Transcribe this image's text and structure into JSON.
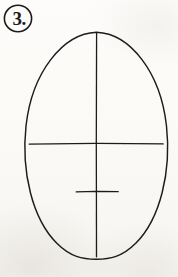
{
  "page": {
    "width": 178,
    "height": 277,
    "background_color": "#fbfaf7",
    "ink_color": "#1b1b1b",
    "medium": "pen-on-paper-scan"
  },
  "step_label": {
    "text": "3.",
    "number": "3",
    "shape": "circled",
    "icon": "circled-step-number",
    "center": {
      "x": 18,
      "y": 18
    },
    "radius": 14.5
  },
  "diagram": {
    "type": "line-drawing",
    "strokes": [
      {
        "name": "head-oval",
        "kind": "ellipse",
        "label": "Head outline (egg shape)",
        "cx": 96,
        "cy": 145,
        "rx": 72,
        "ry": 113.5,
        "stroke_width": 1.4
      },
      {
        "name": "vertical-center-line",
        "kind": "line",
        "label": "Vertical center line",
        "x1": 96.5,
        "y1": 33,
        "x2": 96.5,
        "y2": 257,
        "stroke_width": 1.3
      },
      {
        "name": "eye-line",
        "kind": "line",
        "label": "Horizontal eye line",
        "x1": 29,
        "y1": 143.5,
        "x2": 163,
        "y2": 143.5,
        "stroke_width": 1.3
      },
      {
        "name": "nose-line",
        "kind": "line",
        "label": "Horizontal nose line",
        "x1": 76,
        "y1": 191.5,
        "x2": 118,
        "y2": 191.5,
        "stroke_width": 1.3
      }
    ]
  }
}
